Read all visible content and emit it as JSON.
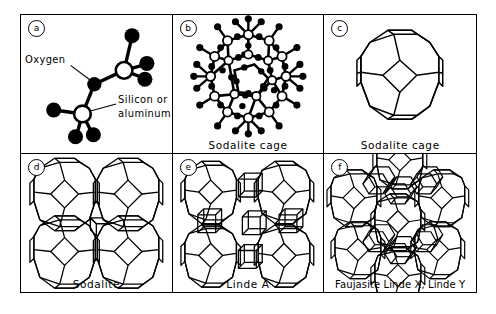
{
  "figure": {
    "rows": 2,
    "columns": 3,
    "line_color": "#000000",
    "background_color": "#ffffff"
  },
  "panels": [
    {
      "letter": "a",
      "caption": "",
      "depicts": "two-tetrahedra-unit",
      "labels": {
        "oxygen": "Oxygen",
        "silicon_or_aluminum_line1": "Silicon or",
        "silicon_or_aluminum_line2": "aluminum"
      }
    },
    {
      "letter": "b",
      "caption": "Sodalite cage",
      "depicts": "ball-and-stick-sodalite-cage",
      "labels": {}
    },
    {
      "letter": "c",
      "caption": "Sodalite cage",
      "depicts": "truncated-octahedron-skeleton",
      "labels": {}
    },
    {
      "letter": "d",
      "caption": "Sodalite",
      "depicts": "sodalite-framework-four-cages",
      "labels": {}
    },
    {
      "letter": "e",
      "caption": "Linde A",
      "depicts": "linde-a-framework",
      "labels": {}
    },
    {
      "letter": "f",
      "caption": "Faujasite Linde X, Linde Y",
      "depicts": "faujasite-framework",
      "labels": {}
    }
  ],
  "legend": {
    "oxygen_atom": "black sphere",
    "silicon_or_aluminum_atom": "white sphere"
  }
}
